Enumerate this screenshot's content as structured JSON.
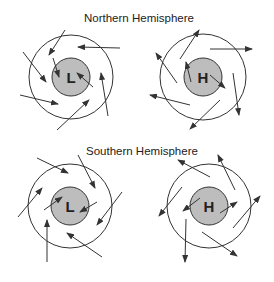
{
  "colors": {
    "background": "#ffffff",
    "stroke": "#333333",
    "core_fill": "#bdbdbd",
    "text": "#222222"
  },
  "panels": [
    {
      "title": "Northern Hemisphere",
      "title_pos": {
        "x": 84,
        "y": 12
      },
      "systems": [
        {
          "label": "L",
          "meaning": "low pressure",
          "center": [
            71,
            77
          ],
          "outer_radius": 42,
          "inner_radius": 19,
          "arrows": [
            {
              "from": [
                65,
                30
              ],
              "to": [
                49,
                55
              ]
            },
            {
              "from": [
                120,
                48
              ],
              "to": [
                78,
                47
              ]
            },
            {
              "from": [
                23,
                52
              ],
              "to": [
                46,
                82
              ]
            },
            {
              "from": [
                53,
                58
              ],
              "to": [
                59,
                77
              ]
            },
            {
              "from": [
                93,
                87
              ],
              "to": [
                77,
                73
              ]
            },
            {
              "from": [
                20,
                95
              ],
              "to": [
                58,
                104
              ]
            },
            {
              "from": [
                57,
                130
              ],
              "to": [
                89,
                100
              ]
            },
            {
              "from": [
                108,
                116
              ],
              "to": [
                101,
                73
              ]
            }
          ]
        },
        {
          "label": "H",
          "meaning": "high pressure",
          "center": [
            203,
            77
          ],
          "outer_radius": 43,
          "inner_radius": 19,
          "arrows": [
            {
              "from": [
                180,
                59
              ],
              "to": [
                199,
                30
              ]
            },
            {
              "from": [
                210,
                49
              ],
              "to": [
                252,
                49
              ]
            },
            {
              "from": [
                177,
                83
              ],
              "to": [
                156,
                53
              ]
            },
            {
              "from": [
                191,
                82
              ],
              "to": [
                186,
                62
              ]
            },
            {
              "from": [
                210,
                75
              ],
              "to": [
                225,
                88
              ]
            },
            {
              "from": [
                190,
                105
              ],
              "to": [
                150,
                95
              ]
            },
            {
              "from": [
                220,
                100
              ],
              "to": [
                190,
                129
              ]
            },
            {
              "from": [
                233,
                73
              ],
              "to": [
                239,
                115
              ]
            }
          ]
        }
      ]
    },
    {
      "title": "Southern Hemisphere",
      "title_pos": {
        "x": 86,
        "y": 145
      },
      "systems": [
        {
          "label": "L",
          "meaning": "low pressure",
          "center": [
            70,
            206
          ],
          "outer_radius": 42,
          "inner_radius": 19,
          "arrows": [
            {
              "from": [
                37,
                158
              ],
              "to": [
                68,
                173
              ]
            },
            {
              "from": [
                78,
                155
              ],
              "to": [
                95,
                188
              ]
            },
            {
              "from": [
                18,
                217
              ],
              "to": [
                42,
                188
              ]
            },
            {
              "from": [
                44,
                210
              ],
              "to": [
                62,
                197
              ]
            },
            {
              "from": [
                97,
                202
              ],
              "to": [
                80,
                212
              ]
            },
            {
              "from": [
                122,
                192
              ],
              "to": [
                97,
                225
              ]
            },
            {
              "from": [
                47,
                262
              ],
              "to": [
                47,
                220
              ]
            },
            {
              "from": [
                102,
                257
              ],
              "to": [
                67,
                233
              ]
            }
          ]
        },
        {
          "label": "H",
          "meaning": "high pressure",
          "center": [
            209,
            206
          ],
          "outer_radius": 42,
          "inner_radius": 19,
          "arrows": [
            {
              "from": [
                210,
                177
              ],
              "to": [
                178,
                160
              ]
            },
            {
              "from": [
                235,
                190
              ],
              "to": [
                218,
                155
              ]
            },
            {
              "from": [
                182,
                187
              ],
              "to": [
                159,
                216
              ]
            },
            {
              "from": [
                200,
                198
              ],
              "to": [
                183,
                211
              ]
            },
            {
              "from": [
                220,
                213
              ],
              "to": [
                237,
                202
              ]
            },
            {
              "from": [
                233,
                228
              ],
              "to": [
                260,
                196
              ]
            },
            {
              "from": [
                186,
                219
              ],
              "to": [
                185,
                262
              ]
            },
            {
              "from": [
                202,
                232
              ],
              "to": [
                237,
                256
              ]
            }
          ]
        }
      ]
    }
  ]
}
